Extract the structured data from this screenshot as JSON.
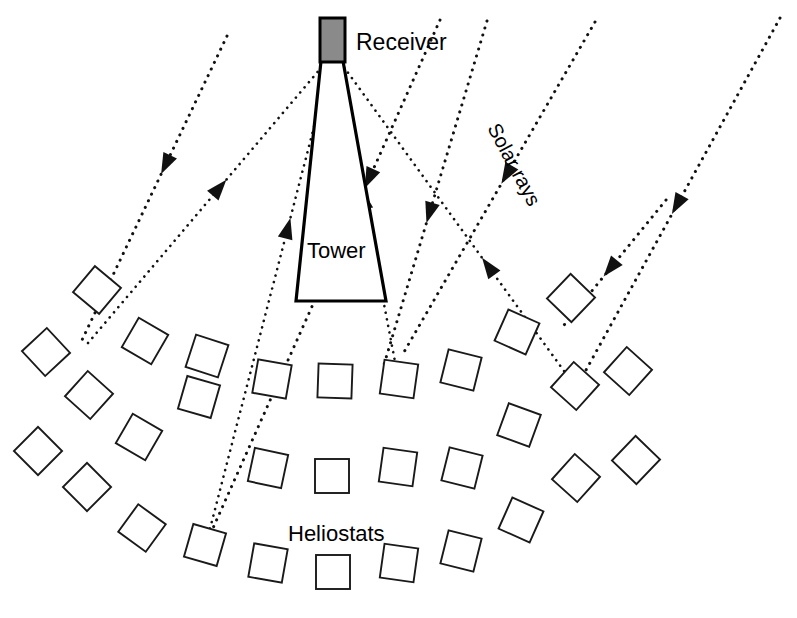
{
  "diagram": {
    "background": "#ffffff",
    "width": 797,
    "height": 618
  },
  "labels": {
    "receiver": "Receiver",
    "tower": "Tower",
    "solar_rays": "Solar rays",
    "heliostats": "Heliostats"
  },
  "colors": {
    "receiver_fill": "#8a8a8a",
    "line": "#111111",
    "outline": "#1a1a1a",
    "background": "#ffffff"
  },
  "receiver": {
    "name": "receiver",
    "x": 320,
    "y": 18,
    "width": 25,
    "height": 44,
    "fill": "#8a8a8a"
  },
  "tower": {
    "name": "tower",
    "points": "321,61 343,61 386,301 296,301"
  },
  "solar_ray_label": {
    "x": 487,
    "y": 128,
    "rotation": 62
  },
  "heliostat_size": 34,
  "heliostat_arcs": [
    {
      "name": "arc-1",
      "items": [
        {
          "x": 46,
          "y": 352,
          "rot": 47
        },
        {
          "x": 97,
          "y": 290,
          "rot": 40,
          "lit": true
        },
        {
          "x": 145,
          "y": 341,
          "rot": 30
        },
        {
          "x": 207,
          "y": 356,
          "rot": 18
        },
        {
          "x": 272,
          "y": 379,
          "rot": 10
        },
        {
          "x": 335,
          "y": 381,
          "rot": 2
        },
        {
          "x": 399,
          "y": 379,
          "rot": 8,
          "lit": true
        },
        {
          "x": 461,
          "y": 370,
          "rot": 14
        },
        {
          "x": 517,
          "y": 332,
          "rot": 24
        },
        {
          "x": 571,
          "y": 298,
          "rot": 44
        },
        {
          "x": 628,
          "y": 371,
          "rot": 42
        }
      ]
    },
    {
      "name": "arc-2",
      "items": [
        {
          "x": 38,
          "y": 451,
          "rot": 45
        },
        {
          "x": 89,
          "y": 395,
          "rot": 42
        },
        {
          "x": 139,
          "y": 437,
          "rot": 30
        },
        {
          "x": 199,
          "y": 397,
          "rot": 16
        },
        {
          "x": 268,
          "y": 468,
          "rot": 12
        },
        {
          "x": 332,
          "y": 476,
          "rot": 0
        },
        {
          "x": 398,
          "y": 467,
          "rot": 8
        },
        {
          "x": 462,
          "y": 468,
          "rot": 14
        },
        {
          "x": 519,
          "y": 425,
          "rot": 20
        },
        {
          "x": 575,
          "y": 386,
          "rot": 42,
          "lit": true
        },
        {
          "x": 636,
          "y": 460,
          "rot": 44
        }
      ]
    },
    {
      "name": "arc-3",
      "items": [
        {
          "x": 87,
          "y": 487,
          "rot": 45
        },
        {
          "x": 142,
          "y": 528,
          "rot": 36
        },
        {
          "x": 205,
          "y": 545,
          "rot": 16,
          "lit": true
        },
        {
          "x": 268,
          "y": 563,
          "rot": 10
        },
        {
          "x": 333,
          "y": 572,
          "rot": 0
        },
        {
          "x": 399,
          "y": 563,
          "rot": 8
        },
        {
          "x": 461,
          "y": 551,
          "rot": 14
        },
        {
          "x": 521,
          "y": 520,
          "rot": 24
        },
        {
          "x": 576,
          "y": 478,
          "rot": 42
        }
      ]
    }
  ],
  "rays": {
    "incoming": [
      {
        "name": "incoming-ray-1",
        "from": [
          227,
          36
        ],
        "to": [
          82,
          340
        ],
        "arrow_t": 0.42
      },
      {
        "name": "incoming-ray-2",
        "from": [
          487,
          21
        ],
        "to": [
          383,
          368
        ],
        "arrow_t": 0.55
      },
      {
        "name": "incoming-ray-3",
        "from": [
          595,
          22
        ],
        "to": [
          404,
          352
        ],
        "arrow_t": 0.46
      },
      {
        "name": "incoming-ray-4",
        "from": [
          780,
          18
        ],
        "to": [
          575,
          390
        ],
        "arrow_t": 0.5
      },
      {
        "name": "incoming-ray-5",
        "from": [
          440,
          20
        ],
        "to": [
          205,
          546
        ],
        "arrow_t": 0.3
      },
      {
        "name": "incoming-ray-6",
        "from": [
          666,
          200
        ],
        "to": [
          560,
          330
        ],
        "arrow_t": 0.52
      }
    ],
    "reflected": [
      {
        "name": "reflected-ray-1",
        "from": [
          88,
          343
        ],
        "to": [
          326,
          62
        ],
        "arrow_t": 0.55
      },
      {
        "name": "reflected-ray-2",
        "from": [
          205,
          548
        ],
        "to": [
          330,
          65
        ],
        "arrow_t": 0.66
      },
      {
        "name": "reflected-ray-3",
        "from": [
          397,
          372
        ],
        "to": [
          338,
          64
        ],
        "arrow_t": 0.56
      },
      {
        "name": "reflected-ray-4",
        "from": [
          572,
          382
        ],
        "to": [
          341,
          63
        ],
        "arrow_t": 0.36
      }
    ]
  }
}
